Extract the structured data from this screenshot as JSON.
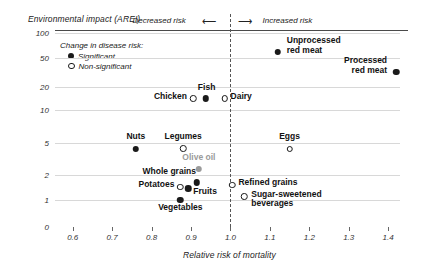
{
  "chart_data": {
    "type": "scatter",
    "title": "",
    "ylabel": "Environmental impact (AREI)",
    "xlabel": "Relative risk of mortality",
    "yscale": "log-like",
    "yticks": [
      "100",
      "50",
      "20",
      "10",
      "5",
      "2",
      "1",
      "0"
    ],
    "ytick_values": [
      100,
      50,
      20,
      10,
      5,
      2,
      1,
      0
    ],
    "xticks": [
      "0.6",
      "0.7",
      "0.8",
      "0.9",
      "1.0",
      "1.1",
      "1.2",
      "1.3",
      "1.4"
    ],
    "xtick_values": [
      0.6,
      0.7,
      0.8,
      0.9,
      1.0,
      1.1,
      1.2,
      1.3,
      1.4
    ],
    "xlim": [
      0.555,
      1.43
    ],
    "grid": true,
    "reference_line_x": 1.0,
    "legend": {
      "title": "Change in disease risk:",
      "entries": [
        {
          "label": "Significant",
          "marker": "filled"
        },
        {
          "label": "Non-significant",
          "marker": "open"
        }
      ]
    },
    "annotations": [
      {
        "text": "Decreased risk",
        "arrow": "left"
      },
      {
        "text": "Increased risk",
        "arrow": "right"
      }
    ],
    "points": [
      {
        "name": "Unprocessed red meat",
        "x": 1.12,
        "y": 62,
        "marker": "filled",
        "label_pos": "right"
      },
      {
        "name": "Processed red meat",
        "x": 1.42,
        "y": 34,
        "marker": "filled",
        "label_pos": "left"
      },
      {
        "name": "Chicken",
        "x": 0.905,
        "y": 15,
        "marker": "open",
        "label_pos": "left"
      },
      {
        "name": "Fish",
        "x": 0.937,
        "y": 15,
        "marker": "filled",
        "label_pos": "above"
      },
      {
        "name": "Dairy",
        "x": 0.985,
        "y": 15,
        "marker": "open",
        "label_pos": "right"
      },
      {
        "name": "Nuts",
        "x": 0.76,
        "y": 4.4,
        "marker": "filled",
        "label_pos": "above"
      },
      {
        "name": "Legumes",
        "x": 0.88,
        "y": 4.5,
        "marker": "open",
        "label_pos": "above"
      },
      {
        "name": "Eggs",
        "x": 1.15,
        "y": 4.4,
        "marker": "open",
        "label_pos": "above"
      },
      {
        "name": "Olive oil",
        "x": 0.92,
        "y": 2.5,
        "marker": "gray",
        "label_pos": "above"
      },
      {
        "name": "Whole grains",
        "x": 0.915,
        "y": 1.7,
        "marker": "filled",
        "label_pos": "above"
      },
      {
        "name": "Potatoes",
        "x": 0.873,
        "y": 1.5,
        "marker": "open",
        "label_pos": "left"
      },
      {
        "name": "Fruits",
        "x": 0.893,
        "y": 1.45,
        "marker": "filled",
        "label_pos": "right"
      },
      {
        "name": "Refined grains",
        "x": 1.005,
        "y": 1.6,
        "marker": "open",
        "label_pos": "right"
      },
      {
        "name": "Vegetables",
        "x": 0.873,
        "y": 1.05,
        "marker": "filled",
        "label_pos": "below"
      },
      {
        "name": "Sugar-sweetened beverages",
        "x": 1.035,
        "y": 1.15,
        "marker": "open",
        "label_pos": "right"
      }
    ]
  }
}
